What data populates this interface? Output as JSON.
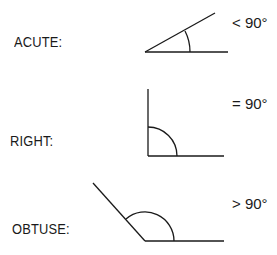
{
  "diagram": {
    "angles": [
      {
        "name": "ACUTE:",
        "relation": "< 90°",
        "color": "#1a1a1a"
      },
      {
        "name": "RIGHT:",
        "relation": "= 90°",
        "color": "#1a1a1a"
      },
      {
        "name": "OBTUSE:",
        "relation": "> 90°",
        "color": "#1a1a1a"
      }
    ]
  }
}
